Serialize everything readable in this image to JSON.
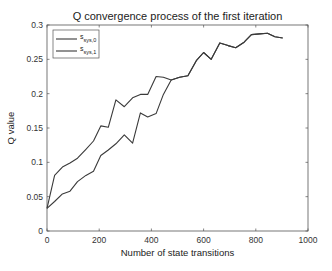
{
  "chart_data": {
    "type": "line",
    "title": "Q convergence process of the first iteration",
    "xlabel": "Number of state transitions",
    "ylabel": "Q value",
    "xlim": [
      0,
      1000
    ],
    "ylim": [
      0,
      0.3
    ],
    "xticks": [
      0,
      200,
      400,
      600,
      800,
      1000
    ],
    "xtick_labels": [
      "0",
      "200",
      "400",
      "600",
      "800",
      "1000"
    ],
    "yticks": [
      0,
      0.05,
      0.1,
      0.15,
      0.2,
      0.25,
      0.3
    ],
    "ytick_labels": [
      "0",
      "0.05",
      "0.1",
      "0.15",
      "0.2",
      "0.25",
      "0.3"
    ],
    "grid": false,
    "legend_position": "upper left",
    "series": [
      {
        "name": "s_sys,0",
        "legend_main": "s",
        "legend_sub": "sys,0",
        "color": "#3a3a3a",
        "x": [
          0,
          29,
          59,
          88,
          117,
          149,
          178,
          206,
          235,
          264,
          296,
          328,
          358,
          386,
          418,
          446,
          476,
          508,
          540,
          572,
          600,
          629,
          662,
          694,
          723,
          755,
          783,
          815,
          845,
          873,
          903
        ],
        "y": [
          0.033,
          0.081,
          0.093,
          0.099,
          0.106,
          0.119,
          0.131,
          0.153,
          0.151,
          0.191,
          0.181,
          0.194,
          0.199,
          0.199,
          0.225,
          0.224,
          0.22,
          0.224,
          0.226,
          0.248,
          0.26,
          0.25,
          0.274,
          0.27,
          0.267,
          0.275,
          0.286,
          0.287,
          0.288,
          0.283,
          0.281
        ]
      },
      {
        "name": "s_sys,1",
        "legend_main": "s",
        "legend_sub": "sys,1",
        "color": "#3a3a3a",
        "x": [
          0,
          29,
          59,
          88,
          117,
          149,
          178,
          206,
          235,
          264,
          296,
          328,
          358,
          386,
          418,
          446,
          476,
          508,
          540,
          572,
          600,
          629,
          662,
          694,
          723,
          755,
          783,
          815,
          845,
          873,
          903
        ],
        "y": [
          0.033,
          0.043,
          0.054,
          0.058,
          0.072,
          0.081,
          0.087,
          0.11,
          0.118,
          0.127,
          0.14,
          0.128,
          0.172,
          0.166,
          0.171,
          0.199,
          0.22,
          0.224,
          0.226,
          0.248,
          0.26,
          0.25,
          0.274,
          0.27,
          0.267,
          0.275,
          0.286,
          0.287,
          0.288,
          0.283,
          0.281
        ]
      }
    ]
  }
}
